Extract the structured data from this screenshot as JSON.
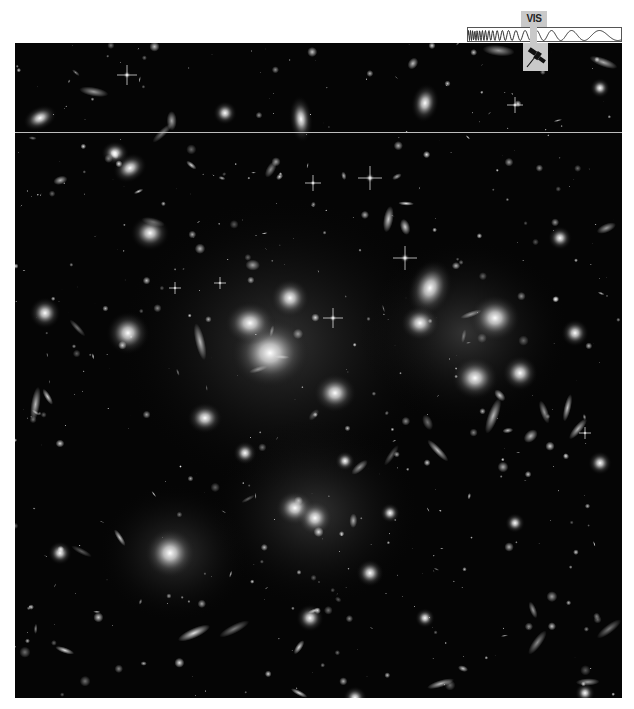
{
  "image": {
    "subject": "galaxy cluster deep field",
    "background_color": "#050505"
  },
  "wavelength_indicator": {
    "band_label": "VIS",
    "icon": "satellite-icon",
    "marker_color": "#c9c9c9"
  },
  "overlay": {
    "scan_line_color": "#bdbdbd"
  }
}
